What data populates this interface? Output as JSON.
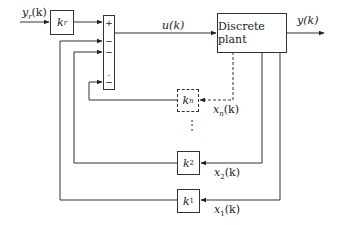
{
  "diagram": {
    "type": "state-feedback block diagram",
    "input_label": "y_r(k)",
    "input_label_main": "y",
    "input_label_sub": "r",
    "input_label_arg": "(k)",
    "gain_reference": {
      "main": "k",
      "sub": "r"
    },
    "summing_junction": {
      "signs": [
        "+",
        "−",
        "−",
        ".",
        ".",
        "−"
      ]
    },
    "control_signal_label": "u(k)",
    "plant_label": "Discrete plant",
    "output_label": "y(k)",
    "feedback_gains": [
      {
        "main": "k",
        "sub": "n",
        "state_main": "x",
        "state_sub": "n",
        "state_arg": "(k)",
        "style": "dashed"
      },
      {
        "main": "k",
        "sub": "2",
        "state_main": "x",
        "state_sub": "2",
        "state_arg": "(k)",
        "style": "solid"
      },
      {
        "main": "k",
        "sub": "1",
        "state_main": "x",
        "state_sub": "1",
        "state_arg": "(k)",
        "style": "solid"
      }
    ],
    "ellipsis": "⋮"
  }
}
